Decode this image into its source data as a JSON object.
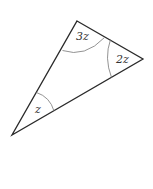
{
  "diagram": {
    "type": "triangle",
    "vertices": {
      "top": [
        77,
        21
      ],
      "right": [
        143,
        59
      ],
      "bottom_left": [
        12,
        135
      ]
    },
    "angles": [
      {
        "vertex": "top",
        "label": "3z"
      },
      {
        "vertex": "right",
        "label": "2z"
      },
      {
        "vertex": "bottom_left",
        "label": "z"
      }
    ],
    "colors": {
      "stroke": "#2a2a2a",
      "arc": "#777777",
      "background": "#ffffff"
    }
  }
}
